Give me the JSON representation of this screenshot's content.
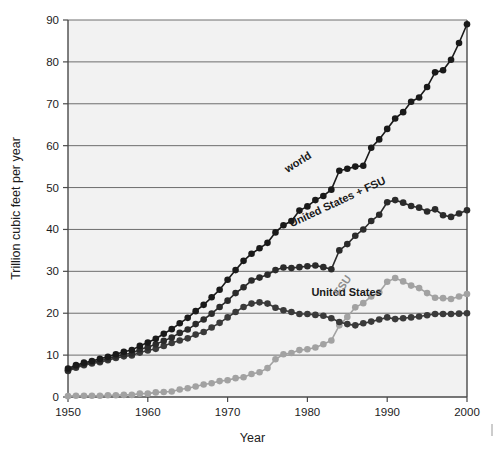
{
  "chart_data": {
    "type": "line",
    "title": "",
    "xlabel": "Year",
    "ylabel": "Trillion cubic feet per year",
    "xlim": [
      1950,
      2000
    ],
    "ylim": [
      0,
      90
    ],
    "xticks": [
      1950,
      1960,
      1970,
      1980,
      1990,
      2000
    ],
    "xtick_labels": [
      "1950",
      "1960",
      "1970",
      "1980",
      "1990",
      "2000"
    ],
    "yticks": [
      0,
      10,
      20,
      30,
      40,
      50,
      60,
      70,
      80,
      90
    ],
    "ytick_labels": [
      "0",
      "10",
      "20",
      "30",
      "40",
      "50",
      "60",
      "70",
      "80",
      "90"
    ],
    "grid": true,
    "grid_axis": "y",
    "legend": "inline-annotations",
    "markers": "filled-circle",
    "x": [
      1950,
      1951,
      1952,
      1953,
      1954,
      1955,
      1956,
      1957,
      1958,
      1959,
      1960,
      1961,
      1962,
      1963,
      1964,
      1965,
      1966,
      1967,
      1968,
      1969,
      1970,
      1971,
      1972,
      1973,
      1974,
      1975,
      1976,
      1977,
      1978,
      1979,
      1980,
      1981,
      1982,
      1983,
      1984,
      1985,
      1986,
      1987,
      1988,
      1989,
      1990,
      1991,
      1992,
      1993,
      1994,
      1995,
      1996,
      1997,
      1998,
      1999,
      2000
    ],
    "series": [
      {
        "name": "world",
        "color": "#1a1a1a",
        "label": "world",
        "label_x": 1977.5,
        "label_y": 53.5,
        "label_rotation": -32,
        "values": [
          6.8,
          7.6,
          8.2,
          8.6,
          9.1,
          9.6,
          10.2,
          10.8,
          11.2,
          12.2,
          13.0,
          13.9,
          15.1,
          16.2,
          17.6,
          18.9,
          20.5,
          22.0,
          23.8,
          25.6,
          28.0,
          30.3,
          32.5,
          34.2,
          35.5,
          36.8,
          39.3,
          41.0,
          42.0,
          44.5,
          45.5,
          47.0,
          48.0,
          49.5,
          54.0,
          54.5,
          55.0,
          55.2,
          59.5,
          61.5,
          64.0,
          66.5,
          68.0,
          70.5,
          71.5,
          74.0,
          77.5,
          78.0,
          80.5,
          84.5,
          89.0
        ]
      },
      {
        "name": "United States + FSU",
        "color": "#2b2b2b",
        "label": "United States + FSU",
        "label_x": 1978.0,
        "label_y": 40.5,
        "label_rotation": -25,
        "values": [
          6.4,
          7.3,
          7.9,
          8.3,
          8.6,
          9.2,
          9.7,
          10.2,
          10.4,
          11.4,
          11.9,
          12.6,
          13.4,
          14.2,
          15.3,
          16.1,
          17.4,
          18.5,
          19.9,
          21.5,
          23.0,
          24.8,
          26.2,
          27.8,
          28.5,
          29.2,
          30.3,
          30.9,
          30.8,
          31.0,
          31.2,
          31.4,
          31.0,
          30.5,
          35.0,
          36.5,
          38.5,
          40.0,
          42.0,
          43.5,
          46.5,
          47.0,
          46.4,
          45.6,
          45.2,
          44.3,
          44.8,
          43.4,
          43.0,
          43.8,
          44.6
        ]
      },
      {
        "name": "United States",
        "color": "#3a3a3a",
        "label": "United States",
        "label_x": 1980.5,
        "label_y": 24.2,
        "label_rotation": 0,
        "values": [
          6.2,
          7.0,
          7.6,
          8.0,
          8.3,
          8.8,
          9.3,
          9.7,
          9.9,
          10.6,
          11.1,
          11.5,
          12.2,
          12.9,
          13.5,
          14.0,
          14.9,
          15.5,
          16.6,
          17.7,
          19.0,
          20.3,
          21.5,
          22.3,
          22.6,
          22.3,
          21.3,
          20.7,
          20.3,
          19.8,
          19.8,
          19.6,
          19.4,
          18.8,
          17.9,
          17.4,
          17.1,
          17.6,
          18.0,
          18.5,
          19.0,
          18.6,
          18.8,
          19.0,
          19.2,
          19.5,
          19.8,
          19.8,
          19.8,
          19.9,
          20.0
        ]
      },
      {
        "name": "FSU",
        "color": "#a2a2a2",
        "label": "FSU",
        "label_x": 1984.0,
        "label_y": 24.0,
        "label_rotation": -55,
        "values": [
          0.2,
          0.3,
          0.3,
          0.3,
          0.3,
          0.4,
          0.4,
          0.5,
          0.5,
          0.8,
          0.8,
          1.1,
          1.2,
          1.3,
          1.8,
          2.1,
          2.5,
          3.0,
          3.3,
          3.8,
          4.0,
          4.5,
          4.7,
          5.5,
          5.9,
          6.9,
          9.0,
          10.2,
          10.5,
          11.2,
          11.4,
          11.8,
          12.6,
          13.5,
          17.1,
          19.1,
          21.4,
          22.4,
          24.0,
          25.0,
          27.5,
          28.4,
          27.6,
          26.6,
          26.0,
          24.8,
          23.7,
          23.6,
          23.4,
          24.0,
          24.6
        ]
      }
    ]
  }
}
